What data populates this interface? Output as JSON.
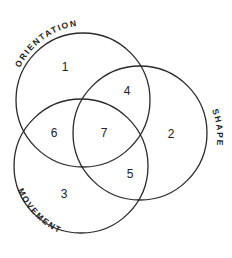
{
  "diagram": {
    "type": "venn",
    "sets": [
      {
        "name": "ORIENTATION",
        "cx": 83,
        "cy": 100,
        "r": 67
      },
      {
        "name": "SHAPE",
        "cx": 140,
        "cy": 133,
        "r": 67
      },
      {
        "name": "MOVEMENT",
        "cx": 81,
        "cy": 166,
        "r": 67
      }
    ],
    "regions": [
      {
        "label": "1",
        "x": 65,
        "y": 68
      },
      {
        "label": "2",
        "x": 171,
        "y": 135
      },
      {
        "label": "3",
        "x": 64,
        "y": 195
      },
      {
        "label": "4",
        "x": 127,
        "y": 92
      },
      {
        "label": "5",
        "x": 130,
        "y": 175
      },
      {
        "label": "6",
        "x": 54,
        "y": 134
      },
      {
        "label": "7",
        "x": 104,
        "y": 134
      }
    ],
    "stroke_color": "#2a2a2a"
  }
}
